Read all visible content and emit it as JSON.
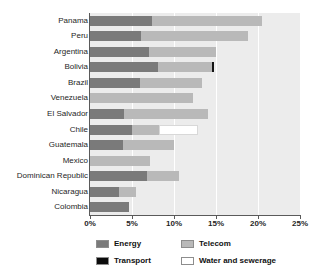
{
  "chart_data": {
    "type": "bar",
    "orientation": "horizontal",
    "stacked": true,
    "title": "",
    "xlabel": "",
    "ylabel": "",
    "xlim": [
      0,
      25
    ],
    "xticks": [
      0,
      5,
      10,
      15,
      20,
      25
    ],
    "xtick_labels": [
      "0%",
      "5%",
      "10%",
      "15%",
      "20%",
      "25%"
    ],
    "grid": true,
    "grid_axis": "x",
    "legend_position": "bottom",
    "categories": [
      "Panama",
      "Peru",
      "Argentina",
      "Bolivia",
      "Brazil",
      "Venezuela",
      "El Salvador",
      "Chile",
      "Guatemala",
      "Mexico",
      "Dominican Republic",
      "Nicaragua",
      "Colombia"
    ],
    "series": [
      {
        "name": "Energy",
        "color": "#7a7a7a",
        "values": [
          7.4,
          6.1,
          7.0,
          8.1,
          6.0,
          0.0,
          4.0,
          5.0,
          3.9,
          0.0,
          6.8,
          3.4,
          4.6
        ]
      },
      {
        "name": "Telecom",
        "color": "#b9b9b9",
        "values": [
          13.1,
          12.7,
          8.0,
          6.4,
          7.3,
          12.3,
          10.0,
          3.2,
          6.1,
          7.2,
          3.8,
          2.1,
          0.0
        ]
      },
      {
        "name": "Transport",
        "color": "#141414",
        "values": [
          0.0,
          0.0,
          0.0,
          0.3,
          0.0,
          0.0,
          0.0,
          0.0,
          0.0,
          0.0,
          0.0,
          0.0,
          0.0
        ]
      },
      {
        "name": "Water and sewerage",
        "color": "#ffffff",
        "values": [
          0.0,
          0.0,
          0.0,
          0.0,
          0.0,
          0.0,
          0.0,
          4.6,
          0.0,
          0.0,
          0.0,
          0.0,
          0.0
        ]
      }
    ],
    "totals": [
      20.5,
      18.8,
      15.0,
      14.8,
      13.3,
      12.3,
      14.0,
      12.8,
      10.0,
      7.2,
      10.6,
      5.5,
      4.6
    ]
  },
  "legend": {
    "items": [
      {
        "label": "Energy",
        "swatch": "energy-swatch"
      },
      {
        "label": "Telecom",
        "swatch": "telecom-swatch"
      },
      {
        "label": "Transport",
        "swatch": "transport-swatch"
      },
      {
        "label": "Water and sewerage",
        "swatch": "water-swatch"
      }
    ]
  }
}
